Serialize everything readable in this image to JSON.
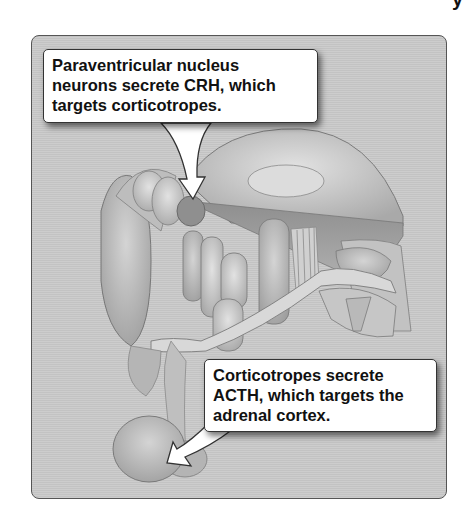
{
  "figure": {
    "type": "anatomical illustration (sagittal brain section, hypothalamus-pituitary)",
    "panel_color": "#c9c9c9",
    "top_right_fragment": "y"
  },
  "callouts": [
    {
      "id": "paraventricular",
      "lines": [
        "Paraventricular nucleus",
        "neurons secrete CRH, which",
        "targets corticotropes."
      ],
      "arrow_target": "paraventricular nucleus (hypothalamus)"
    },
    {
      "id": "corticotropes",
      "lines": [
        "Corticotropes secrete",
        "ACTH, which targets the",
        "adrenal cortex."
      ],
      "arrow_target": "anterior pituitary"
    }
  ]
}
